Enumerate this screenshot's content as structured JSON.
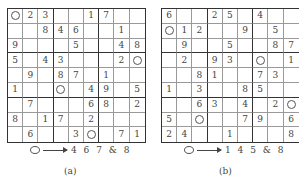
{
  "panels": [
    {
      "id": "a",
      "caption": "(a)",
      "legend": {
        "symbol": "circle-icon",
        "arrow": "arrow-right-icon",
        "text": "4 6 7 & 8"
      },
      "grid": [
        [
          "O",
          "2",
          "3",
          "",
          "",
          "1",
          "7",
          "",
          ""
        ],
        [
          "",
          "",
          "8",
          "4",
          "6",
          "",
          "",
          "1",
          ""
        ],
        [
          "9",
          "",
          "",
          "",
          "5",
          "",
          "",
          "4",
          "8"
        ],
        [
          "5",
          "",
          "4",
          "3",
          "",
          "",
          "",
          "2",
          "O"
        ],
        [
          "",
          "9",
          "",
          "8",
          "7",
          "",
          "1",
          "",
          ""
        ],
        [
          "1",
          "",
          "",
          "O",
          "",
          "4",
          "9",
          "",
          "5"
        ],
        [
          "",
          "7",
          "",
          "",
          "",
          "6",
          "8",
          "",
          "2"
        ],
        [
          "8",
          "",
          "1",
          "7",
          "",
          "2",
          "",
          "",
          ""
        ],
        [
          "",
          "6",
          "",
          "",
          "3",
          "O",
          "",
          "7",
          "1"
        ]
      ]
    },
    {
      "id": "b",
      "caption": "(b)",
      "legend": {
        "symbol": "circle-icon",
        "arrow": "arrow-right-icon",
        "text": "1 4 5 & 8"
      },
      "grid": [
        [
          "6",
          "",
          "",
          "2",
          "5",
          "",
          "4",
          "",
          ""
        ],
        [
          "O",
          "1",
          "2",
          "",
          "",
          "9",
          "",
          "5",
          ""
        ],
        [
          "",
          "9",
          "",
          "",
          "5",
          "",
          "",
          "8",
          "7"
        ],
        [
          "",
          "2",
          "",
          "9",
          "3",
          "",
          "O",
          "",
          "1"
        ],
        [
          "",
          "",
          "8",
          "1",
          "",
          "",
          "7",
          "3",
          ""
        ],
        [
          "1",
          "",
          "3",
          "",
          "",
          "8",
          "5",
          "",
          ""
        ],
        [
          "",
          "",
          "6",
          "3",
          "",
          "4",
          "",
          "2",
          "O"
        ],
        [
          "5",
          "",
          "O",
          "",
          "",
          "7",
          "9",
          "",
          "6"
        ],
        [
          "2",
          "4",
          "",
          "",
          "1",
          "",
          "",
          "",
          "8"
        ]
      ]
    }
  ]
}
